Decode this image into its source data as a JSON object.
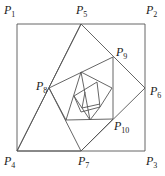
{
  "diagram": {
    "type": "nested-squares-spiral",
    "line_color": "#555555",
    "labels": [
      {
        "id": "P1",
        "text": "P",
        "sub": "1",
        "x": 4,
        "y": 4
      },
      {
        "id": "P2",
        "text": "P",
        "sub": "2",
        "x": 146,
        "y": 4
      },
      {
        "id": "P3",
        "text": "P",
        "sub": "3",
        "x": 146,
        "y": 155
      },
      {
        "id": "P4",
        "text": "P",
        "sub": "4",
        "x": 4,
        "y": 155
      },
      {
        "id": "P5",
        "text": "P",
        "sub": "5",
        "x": 76,
        "y": 4
      },
      {
        "id": "P6",
        "text": "P",
        "sub": "6",
        "x": 150,
        "y": 85
      },
      {
        "id": "P7",
        "text": "P",
        "sub": "7",
        "x": 78,
        "y": 155
      },
      {
        "id": "P8",
        "text": "P",
        "sub": "8",
        "x": 36,
        "y": 80
      },
      {
        "id": "P9",
        "text": "P",
        "sub": "9",
        "x": 116,
        "y": 46
      },
      {
        "id": "P10",
        "text": "P",
        "sub": "10",
        "x": 114,
        "y": 120
      }
    ]
  }
}
